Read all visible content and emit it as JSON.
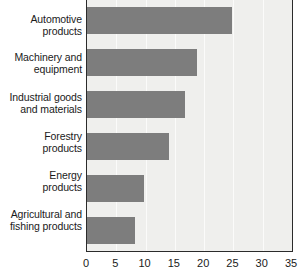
{
  "chart_data": {
    "type": "bar",
    "orientation": "horizontal",
    "title": "",
    "subtitle": "",
    "xlabel": "",
    "ylabel": "",
    "categories": [
      "Automotive\nproducts",
      "Machinery and\nequipment",
      "Industrial goods\nand materials",
      "Forestry\nproducts",
      "Energy\nproducts",
      "Agricultural and\nfishing products"
    ],
    "category_lines": [
      [
        "Automotive",
        "products"
      ],
      [
        "Machinery and",
        "equipment"
      ],
      [
        "Industrial goods",
        "and materials"
      ],
      [
        "Forestry",
        "products"
      ],
      [
        "Energy",
        "products"
      ],
      [
        "Agricultural and",
        "fishing products"
      ]
    ],
    "values": [
      24.7,
      18.8,
      16.7,
      14.0,
      9.7,
      8.2
    ],
    "xlim": [
      0,
      35
    ],
    "xticks": [
      0,
      5,
      10,
      15,
      20,
      25,
      30,
      35
    ],
    "xtick_labels": [
      "0",
      "5",
      "10",
      "15",
      "20",
      "25",
      "30",
      "35"
    ],
    "grid": true,
    "grid_axis": "x",
    "legend": false,
    "bar_color": "#7d7d7d",
    "plot_background": "#efefed",
    "gridline_color": "#fbfbfa",
    "axis_color": "#2b2b2b",
    "text_color": "#1a1a1a"
  }
}
